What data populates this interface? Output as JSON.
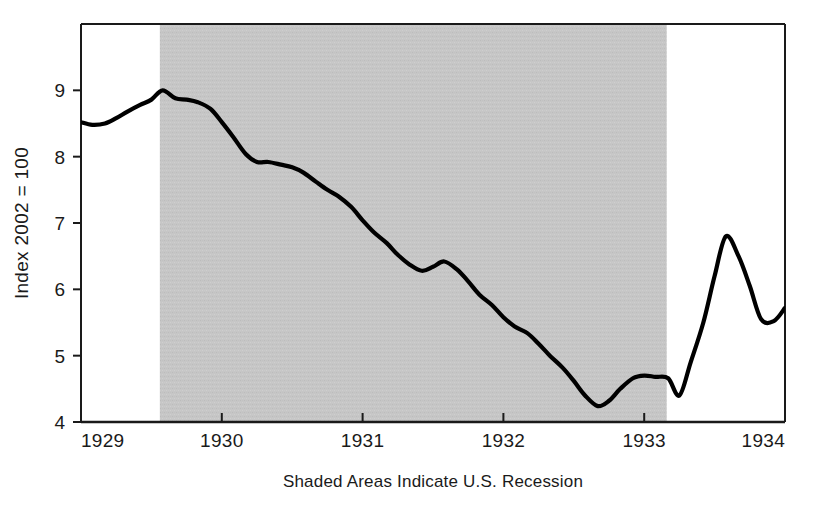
{
  "chart_data": {
    "type": "line",
    "title": "",
    "subtitle": "",
    "xlabel": "Shaded Areas Indicate U.S. Recession",
    "ylabel": "Index 2002 = 100",
    "xlim": [
      1929.0,
      1934.0
    ],
    "ylim": [
      4.0,
      10.0
    ],
    "grid": false,
    "legend": null,
    "x_ticks": [
      "1929",
      "1930",
      "1931",
      "1932",
      "1933",
      "1934"
    ],
    "x_tick_values": [
      1929,
      1930,
      1931,
      1932,
      1933,
      1934
    ],
    "y_ticks": [
      "4",
      "5",
      "6",
      "7",
      "8",
      "9"
    ],
    "y_tick_values": [
      4,
      5,
      6,
      7,
      8,
      9
    ],
    "line_color": "#000000",
    "line_width": 4,
    "shading": {
      "label": "U.S. Recession",
      "color": "#c4c4c4",
      "spans": [
        [
          1929.56,
          1933.16
        ]
      ]
    },
    "series": [
      {
        "name": "Industrial Production Index",
        "x": [
          1929.0,
          1929.08,
          1929.17,
          1929.25,
          1929.33,
          1929.42,
          1929.5,
          1929.58,
          1929.67,
          1929.75,
          1929.83,
          1929.92,
          1930.0,
          1930.08,
          1930.17,
          1930.25,
          1930.33,
          1930.42,
          1930.5,
          1930.58,
          1930.67,
          1930.75,
          1930.83,
          1930.92,
          1931.0,
          1931.08,
          1931.17,
          1931.25,
          1931.33,
          1931.42,
          1931.5,
          1931.58,
          1931.67,
          1931.75,
          1931.83,
          1931.92,
          1932.0,
          1932.08,
          1932.17,
          1932.25,
          1932.33,
          1932.42,
          1932.5,
          1932.58,
          1932.67,
          1932.75,
          1932.83,
          1932.92,
          1933.0,
          1933.08,
          1933.17,
          1933.25,
          1933.33,
          1933.42,
          1933.5,
          1933.58,
          1933.67,
          1933.75,
          1933.83,
          1933.92,
          1934.0
        ],
        "y": [
          8.52,
          8.48,
          8.5,
          8.58,
          8.68,
          8.78,
          8.86,
          9.0,
          8.88,
          8.86,
          8.82,
          8.72,
          8.52,
          8.3,
          8.04,
          7.92,
          7.92,
          7.88,
          7.84,
          7.76,
          7.62,
          7.5,
          7.4,
          7.24,
          7.04,
          6.86,
          6.7,
          6.52,
          6.38,
          6.28,
          6.34,
          6.42,
          6.3,
          6.12,
          5.92,
          5.76,
          5.58,
          5.44,
          5.34,
          5.18,
          5.0,
          4.82,
          4.62,
          4.4,
          4.24,
          4.32,
          4.5,
          4.66,
          4.7,
          4.68,
          4.66,
          4.4,
          4.9,
          5.5,
          6.2,
          6.8,
          6.5,
          6.05,
          5.55,
          5.52,
          5.72
        ]
      }
    ]
  },
  "axes": {
    "y_axis_title": "Index 2002 = 100",
    "x_axis_caption": "Shaded Areas Indicate U.S. Recession"
  },
  "ticks": {
    "x": [
      {
        "label": "1929"
      },
      {
        "label": "1930"
      },
      {
        "label": "1931"
      },
      {
        "label": "1932"
      },
      {
        "label": "1933"
      },
      {
        "label": "1934"
      }
    ],
    "y": [
      {
        "label": "9"
      },
      {
        "label": "8"
      },
      {
        "label": "7"
      },
      {
        "label": "6"
      },
      {
        "label": "5"
      },
      {
        "label": "4"
      }
    ]
  },
  "colors": {
    "line": "#000000",
    "recession_band": "#c4c4c4",
    "axis": "#1a1a1a",
    "background": "#ffffff"
  }
}
